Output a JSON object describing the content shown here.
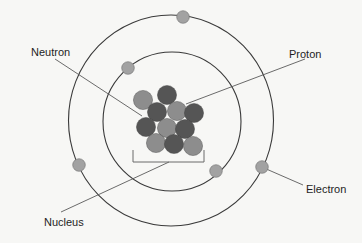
{
  "diagram": {
    "colors": {
      "background": "#f7f7f5",
      "orbit": "#3a3a3a",
      "pointer": "#5a5a5a",
      "neutron": "#555555",
      "proton": "#8d8d8d",
      "electron": "#a2a2a2",
      "bracket": "#6a6a6a"
    },
    "labels": {
      "neutron": "Neutron",
      "proton": "Proton",
      "nucleus": "Nucleus",
      "electron": "Electron"
    },
    "orbits": [
      {
        "name": "inner-orbit",
        "cx": 172,
        "cy": 121.5,
        "rx": 69,
        "ry": 69.5
      },
      {
        "name": "outer-orbit",
        "cx": 171,
        "cy": 120.5,
        "rx": 102.5,
        "ry": 105.5
      }
    ],
    "electrons": [
      {
        "x": 183,
        "y": 17
      },
      {
        "x": 128,
        "y": 68
      },
      {
        "x": 79,
        "y": 165
      },
      {
        "x": 216,
        "y": 171
      },
      {
        "x": 262,
        "y": 167
      }
    ],
    "nucleus_particles": [
      {
        "x": 143,
        "y": 100,
        "type": "proton"
      },
      {
        "x": 167,
        "y": 95,
        "type": "neutron"
      },
      {
        "x": 157,
        "y": 112,
        "type": "neutron"
      },
      {
        "x": 177,
        "y": 111,
        "type": "proton"
      },
      {
        "x": 194,
        "y": 113,
        "type": "neutron"
      },
      {
        "x": 146,
        "y": 127,
        "type": "neutron"
      },
      {
        "x": 167,
        "y": 128,
        "type": "proton"
      },
      {
        "x": 185,
        "y": 129,
        "type": "neutron"
      },
      {
        "x": 156,
        "y": 143,
        "type": "proton"
      },
      {
        "x": 174,
        "y": 144,
        "type": "neutron"
      },
      {
        "x": 193,
        "y": 146,
        "type": "proton"
      }
    ],
    "bracket": {
      "x1": 133,
      "x2": 204,
      "top": 150,
      "bottom": 162
    }
  }
}
